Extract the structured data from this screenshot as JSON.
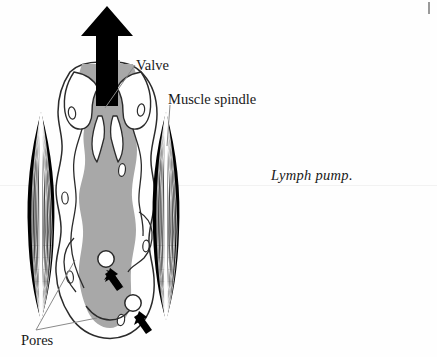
{
  "figure": {
    "caption": "Lymph pump.",
    "labels": [
      {
        "id": "valve",
        "text": "Valve",
        "name": "label-valve"
      },
      {
        "id": "muscle_spindle",
        "text": "Muscle spindle",
        "name": "label-muscle-spindle"
      },
      {
        "id": "pores",
        "text": "Pores",
        "name": "label-pores"
      }
    ],
    "elements": {
      "flow_arrow": "upward-flow-arrow",
      "lymph_vessel": "lymph-vessel-lumen",
      "valve_leaflets": "bicuspid-valve",
      "muscle_spindle_left": "muscle-spindle-left",
      "muscle_spindle_right": "muscle-spindle-right",
      "pore_upper": "pore-upper",
      "pore_lower": "pore-lower",
      "pore_arrow_upper": "pore-inflow-arrow-upper",
      "pore_arrow_lower": "pore-inflow-arrow-lower",
      "endothelial_nuclei": "endothelial-cell-nuclei"
    }
  },
  "colors": {
    "lumen_fill": "#a8a8a8",
    "outline": "#2b2b2b",
    "ink": "#181818",
    "arrow": "#000000",
    "wall_fill": "#ffffff",
    "leader_line": "#8a8a8a",
    "background": "#fefefe"
  }
}
